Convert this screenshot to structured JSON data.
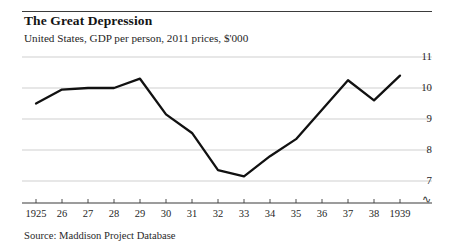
{
  "header": {
    "title": "The Great Depression",
    "subtitle": "United States, GDP per person, 2011 prices, $'000"
  },
  "footer": {
    "source": "Source: Maddison Project Database"
  },
  "axis": {
    "break_symbol": "∿",
    "y_ticks": [
      "11",
      "10",
      "9",
      "8",
      "7"
    ],
    "x_ticks": [
      "1925",
      "26",
      "27",
      "28",
      "29",
      "30",
      "31",
      "32",
      "33",
      "34",
      "35",
      "36",
      "37",
      "38",
      "1939"
    ]
  },
  "colors": {
    "line": "#111111",
    "grid": "#c9c9c9",
    "axis": "#3b3b3b",
    "text": "#1a1a1a",
    "background": "#ffffff"
  },
  "chart_data": {
    "type": "line",
    "title": "The Great Depression",
    "subtitle": "United States, GDP per person, 2011 prices, $'000",
    "xlabel": "",
    "ylabel": "",
    "ylim": [
      6.6,
      11
    ],
    "yticks": [
      7,
      8,
      9,
      10,
      11
    ],
    "grid": true,
    "legend": "none",
    "axis_break": true,
    "x": [
      1925,
      1926,
      1927,
      1928,
      1929,
      1930,
      1931,
      1932,
      1933,
      1934,
      1935,
      1936,
      1937,
      1938,
      1939
    ],
    "categories": [
      "1925",
      "26",
      "27",
      "28",
      "29",
      "30",
      "31",
      "32",
      "33",
      "34",
      "35",
      "36",
      "37",
      "38",
      "1939"
    ],
    "values": [
      9.5,
      9.95,
      10.0,
      10.0,
      10.3,
      9.15,
      8.55,
      7.35,
      7.15,
      7.8,
      8.35,
      9.3,
      10.25,
      9.6,
      10.4
    ],
    "series": [
      {
        "name": "GDP per person",
        "values": [
          9.5,
          9.95,
          10.0,
          10.0,
          10.3,
          9.15,
          8.55,
          7.35,
          7.15,
          7.8,
          8.35,
          9.3,
          10.25,
          9.6,
          10.4
        ]
      }
    ],
    "source": "Source: Maddison Project Database"
  }
}
